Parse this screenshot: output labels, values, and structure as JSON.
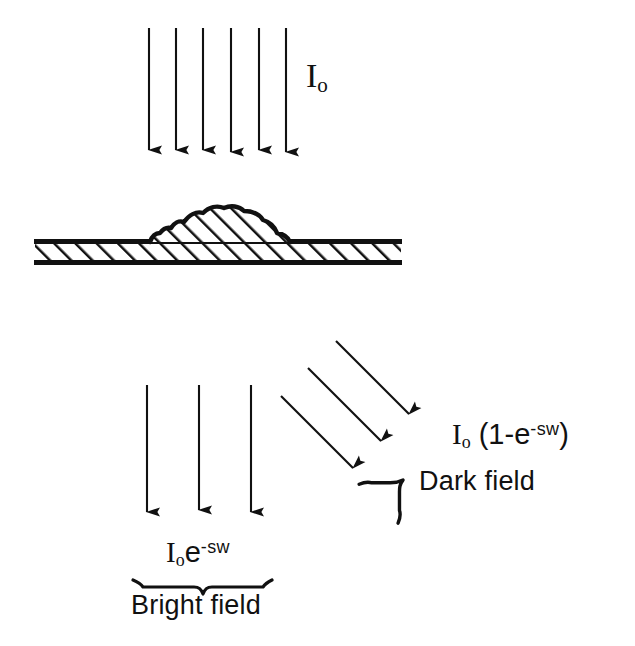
{
  "figure": {
    "type": "optical-scattering-diagram",
    "background_color": "#ffffff",
    "ink_color": "#111111",
    "incident_beam": {
      "label": "I",
      "label_subscript": "o",
      "arrow_count": 6,
      "direction": "downward"
    },
    "substrate": {
      "name": "hatched-substrate",
      "hatch_angle_degrees": 45,
      "fill": "#ffffff",
      "stroke": "#111111"
    },
    "particle": {
      "name": "surface-particle",
      "hatch_angle_degrees": 45,
      "shape": "irregular-mound"
    },
    "transmitted_beam": {
      "arrow_count": 3,
      "direction": "downward",
      "formula_base": "I",
      "formula_subscript": "o",
      "formula_variable": "e",
      "formula_exponent": "-sw",
      "caption": "Bright field"
    },
    "scattered_beam": {
      "arrow_count": 3,
      "direction": "diagonal-down-right",
      "angle_degrees": 45,
      "formula_base": "I",
      "formula_subscript": "o",
      "formula_open": " (1-",
      "formula_variable": "e",
      "formula_exponent": "-sw",
      "formula_close": ")",
      "caption": "Dark field"
    }
  }
}
